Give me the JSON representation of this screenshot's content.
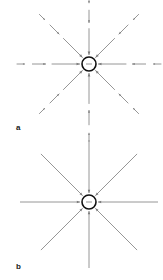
{
  "figure": {
    "panels": [
      {
        "id": "a",
        "label": "a",
        "description": "Field vectors around a negative point charge, drawn as separate arrows whose length decreases with distance",
        "charge": {
          "sign": "negative",
          "symbol": "−"
        },
        "direction": "inward",
        "line_style": "dashed-vectors",
        "num_directions": 8,
        "vectors_per_direction": 3
      },
      {
        "id": "b",
        "label": "b",
        "description": "Continuous electric field lines converging on a negative point charge",
        "charge": {
          "sign": "negative",
          "symbol": "−"
        },
        "direction": "inward",
        "line_style": "continuous-lines",
        "num_directions": 8
      }
    ],
    "colors": {
      "line": "#8a8a8a",
      "arrowhead": "#7a7a7a",
      "charge_outline": "#111111",
      "label": "#1a1a1a",
      "background": "#ffffff"
    }
  }
}
